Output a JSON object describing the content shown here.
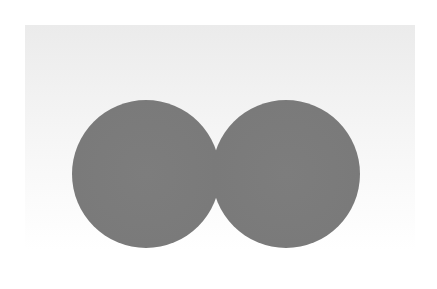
{
  "scene": {
    "description": "Two adjacent gray circles on a light gray-to-white background",
    "background_color": "#ffffff",
    "panel_color": "#ececec",
    "circles": [
      {
        "id": "left",
        "cx": 146,
        "cy": 174,
        "diameter": 148,
        "color": "#7a7a7a"
      },
      {
        "id": "right",
        "cx": 286,
        "cy": 174,
        "diameter": 148,
        "color": "#7a7a7a"
      }
    ]
  }
}
